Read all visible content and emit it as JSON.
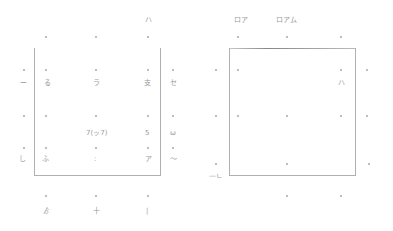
{
  "left_panel": {
    "top_label": "ハ",
    "rows": [
      {
        "left": "ー",
        "cells": [
          "る",
          "ラ",
          "支"
        ],
        "right": "セ"
      },
      {
        "left": "",
        "cells": [
          "",
          "7(ッ7)",
          "5"
        ],
        "right": "ω"
      },
      {
        "left": "し",
        "cells": [
          "ふ",
          ":",
          "ア"
        ],
        "right": "〜"
      }
    ],
    "bottom_labels": [
      "ゟ",
      "十",
      "|"
    ]
  },
  "right_panel": {
    "top_labels": [
      "ロア",
      "ロアム"
    ],
    "inner_label": "ハ",
    "corner_label": "—ㄴ"
  }
}
